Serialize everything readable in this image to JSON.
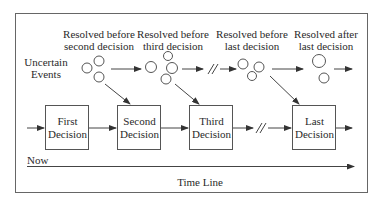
{
  "diagram": {
    "headers": [
      {
        "line1": "Resolved before",
        "line2": "second decision"
      },
      {
        "line1": "Resolved before",
        "line2": "third decision"
      },
      {
        "line1": "Resolved before",
        "line2": "last decision"
      },
      {
        "line1": "Resolved after",
        "line2": "last decision"
      }
    ],
    "uncertain_label": {
      "line1": "Uncertain",
      "line2": "Events"
    },
    "decisions": [
      {
        "line1": "First",
        "line2": "Decision"
      },
      {
        "line1": "Second",
        "line2": "Decision"
      },
      {
        "line1": "Third",
        "line2": "Decision"
      },
      {
        "line1": "Last",
        "line2": "Decision"
      }
    ],
    "now_label": "Now",
    "timeline_label": "Time Line",
    "colors": {
      "stroke": "#555555",
      "frame": "#666666",
      "text": "#2a2a2a"
    }
  }
}
